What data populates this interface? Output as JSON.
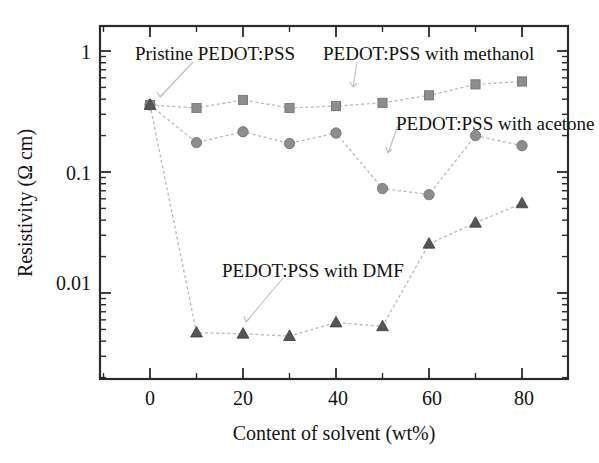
{
  "chart_data": {
    "type": "line",
    "title": "",
    "xlabel": "Content of solvent (wt%)",
    "ylabel": "Resistivity (Ω cm)",
    "yscale": "log",
    "ylim": [
      0.003,
      1.3
    ],
    "xlim": [
      -5,
      87
    ],
    "grid": false,
    "legend_position": "inline annotations with leader lines",
    "x_ticks": [
      "0",
      "20",
      "40",
      "60",
      "80"
    ],
    "x_tick_values": [
      0,
      20,
      40,
      60,
      80
    ],
    "y_ticks": [
      "1",
      "0.1",
      "0.01"
    ],
    "y_tick_values": [
      1,
      0.1,
      0.01
    ],
    "x": [
      0,
      10,
      20,
      30,
      40,
      50,
      60,
      70,
      80
    ],
    "series": [
      {
        "name": "PEDOT:PSS with methanol",
        "marker": "square",
        "color": "#8d8d8d",
        "values": [
          0.358,
          0.338,
          0.394,
          0.338,
          0.351,
          0.373,
          0.43,
          0.53,
          0.56
        ]
      },
      {
        "name": "PEDOT:PSS with acetone",
        "marker": "circle",
        "color": "#8d8d8d",
        "values": [
          0.358,
          0.175,
          0.215,
          0.172,
          0.21,
          0.073,
          0.065,
          0.2,
          0.165
        ]
      },
      {
        "name": "PEDOT:PSS with DMF",
        "marker": "triangle",
        "color": "#555555",
        "values": [
          0.358,
          0.0047,
          0.0046,
          0.0044,
          0.0057,
          0.0053,
          0.0255,
          0.038,
          0.055
        ]
      }
    ],
    "annotations": [
      {
        "id": "pristine",
        "text": "Pristine PEDOT:PSS",
        "points_to_x": 0,
        "points_to_y": 0.358
      },
      {
        "id": "methanol",
        "text": "PEDOT:PSS with methanol",
        "points_to_x": 20,
        "points_to_y": 0.394
      },
      {
        "id": "acetone",
        "text": "PEDOT:PSS with acetone",
        "points_to_x": 40,
        "points_to_y": 0.21
      },
      {
        "id": "dmf",
        "text": "PEDOT:PSS with DMF",
        "points_to_x": 20,
        "points_to_y": 0.0046
      }
    ]
  },
  "axes": {
    "x_title": "Content of solvent (wt%)",
    "y_title": "Resistivity (Ω cm)",
    "x_tick_labels": [
      "0",
      "20",
      "40",
      "60",
      "80"
    ],
    "y_tick_labels": [
      "1",
      "0.1",
      "0.01"
    ]
  },
  "annotations": {
    "pristine": "Pristine PEDOT:PSS",
    "methanol": "PEDOT:PSS with methanol",
    "acetone": "PEDOT:PSS with acetone",
    "dmf": "PEDOT:PSS with DMF"
  }
}
